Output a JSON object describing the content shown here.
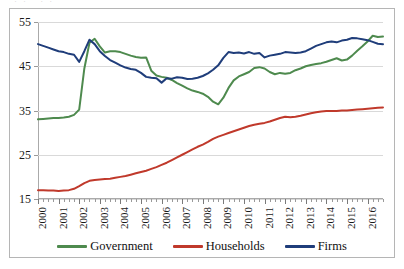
{
  "figure": {
    "top_artifact": "··  ··",
    "background": "#ffffff",
    "border_color": "#b5b5b5"
  },
  "legend": {
    "position": "bottom-center",
    "items": [
      {
        "label": "Government",
        "color": "#4E8A4E",
        "name": "government"
      },
      {
        "label": "Households",
        "color": "#C0392B",
        "name": "households"
      },
      {
        "label": "Firms",
        "color": "#1F3D7A",
        "name": "firms"
      }
    ]
  },
  "chart_data": {
    "type": "line",
    "title": "",
    "subtitle": "",
    "xlabel": "",
    "ylabel": "",
    "xlim": [
      2000,
      2016.75
    ],
    "ylim": [
      15,
      55
    ],
    "yticks": [
      15,
      25,
      35,
      45,
      55
    ],
    "ytick_labels": [
      "15",
      "25",
      "35",
      "45",
      "55"
    ],
    "grid": "horizontal",
    "xticks": [
      2000,
      2001,
      2002,
      2003,
      2004,
      2005,
      2006,
      2007,
      2008,
      2009,
      2010,
      2011,
      2012,
      2013,
      2014,
      2015,
      2016
    ],
    "xtick_labels": [
      "2000",
      "2001",
      "2002",
      "2003",
      "2004",
      "2005",
      "2006",
      "2007",
      "2008",
      "2009",
      "2010",
      "2011",
      "2012",
      "2013",
      "2014",
      "2015",
      "2016"
    ],
    "minor_xticks_per_year": 4,
    "x": [
      2000.0,
      2000.25,
      2000.5,
      2000.75,
      2001.0,
      2001.25,
      2001.5,
      2001.75,
      2002.0,
      2002.25,
      2002.5,
      2002.75,
      2003.0,
      2003.25,
      2003.5,
      2003.75,
      2004.0,
      2004.25,
      2004.5,
      2004.75,
      2005.0,
      2005.25,
      2005.5,
      2005.75,
      2006.0,
      2006.25,
      2006.5,
      2006.75,
      2007.0,
      2007.25,
      2007.5,
      2007.75,
      2008.0,
      2008.25,
      2008.5,
      2008.75,
      2009.0,
      2009.25,
      2009.5,
      2009.75,
      2010.0,
      2010.25,
      2010.5,
      2010.75,
      2011.0,
      2011.25,
      2011.5,
      2011.75,
      2012.0,
      2012.25,
      2012.5,
      2012.75,
      2013.0,
      2013.25,
      2013.5,
      2013.75,
      2014.0,
      2014.25,
      2014.5,
      2014.75,
      2015.0,
      2015.25,
      2015.5,
      2015.75,
      2016.0,
      2016.25,
      2016.5,
      2016.75
    ],
    "series": [
      {
        "name": "Government",
        "color": "#4E8A4E",
        "values": [
          33.0,
          33.1,
          33.2,
          33.3,
          33.3,
          33.4,
          33.6,
          34.0,
          35.2,
          44.5,
          50.3,
          51.2,
          49.5,
          48.1,
          48.4,
          48.4,
          48.2,
          47.8,
          47.4,
          47.1,
          46.9,
          47.0,
          44.0,
          42.9,
          42.6,
          42.4,
          41.9,
          41.2,
          40.6,
          40.0,
          39.5,
          39.2,
          38.8,
          38.1,
          37.0,
          36.4,
          37.9,
          40.1,
          41.8,
          42.7,
          43.2,
          43.7,
          44.6,
          44.8,
          44.5,
          43.7,
          43.2,
          43.5,
          43.3,
          43.5,
          44.1,
          44.5,
          45.0,
          45.3,
          45.5,
          45.7,
          46.0,
          46.4,
          46.8,
          46.3,
          46.5,
          47.4,
          48.5,
          49.5,
          50.6,
          51.9,
          51.6,
          51.7
        ]
      },
      {
        "name": "Households",
        "color": "#C0392B",
        "values": [
          17.0,
          17.0,
          16.9,
          16.9,
          16.8,
          16.9,
          17.0,
          17.3,
          17.9,
          18.6,
          19.1,
          19.3,
          19.4,
          19.5,
          19.6,
          19.8,
          20.0,
          20.2,
          20.5,
          20.8,
          21.1,
          21.4,
          21.8,
          22.2,
          22.7,
          23.2,
          23.8,
          24.4,
          25.0,
          25.6,
          26.2,
          26.8,
          27.3,
          27.9,
          28.6,
          29.1,
          29.5,
          29.9,
          30.3,
          30.7,
          31.1,
          31.5,
          31.8,
          32.0,
          32.2,
          32.5,
          32.9,
          33.3,
          33.6,
          33.5,
          33.6,
          33.8,
          34.1,
          34.4,
          34.6,
          34.8,
          34.9,
          34.9,
          34.9,
          35.0,
          35.0,
          35.1,
          35.2,
          35.3,
          35.4,
          35.5,
          35.6,
          35.7
        ]
      },
      {
        "name": "Firms",
        "color": "#1F3D7A",
        "values": [
          50.0,
          49.6,
          49.2,
          48.8,
          48.4,
          48.2,
          47.8,
          47.6,
          46.0,
          48.4,
          51.0,
          50.0,
          48.4,
          47.3,
          46.4,
          45.8,
          45.2,
          44.7,
          44.4,
          44.2,
          43.5,
          42.6,
          42.4,
          42.3,
          41.3,
          42.3,
          42.2,
          42.5,
          42.4,
          42.1,
          42.2,
          42.4,
          42.8,
          43.4,
          44.2,
          45.2,
          46.9,
          48.2,
          48.0,
          48.1,
          47.9,
          48.2,
          47.8,
          48.0,
          47.0,
          47.4,
          47.6,
          47.8,
          48.2,
          48.1,
          48.0,
          48.1,
          48.4,
          49.0,
          49.6,
          50.0,
          50.4,
          50.6,
          50.4,
          50.8,
          51.0,
          51.4,
          51.3,
          51.1,
          50.9,
          50.5,
          50.1,
          50.0
        ]
      }
    ]
  }
}
